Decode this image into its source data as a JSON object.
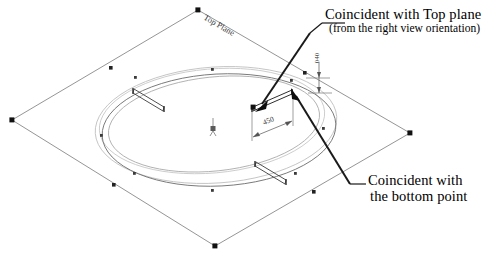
{
  "diagram": {
    "title_label": "Top Plane",
    "origin_marker": "origin-symbol",
    "annotations": {
      "top_callout": {
        "line1": "Coincident with Top plane",
        "line2": "(from the right view orientation)"
      },
      "bottom_callout": {
        "line1": "Coincident with",
        "line2": "the bottom point"
      }
    },
    "dimensions": [
      {
        "name": "horizontal-dimension",
        "value": "450"
      },
      {
        "name": "vertical-dimension",
        "value": "040"
      }
    ],
    "colors": {
      "stroke_dark": "#2b2b2b",
      "stroke_plane": "#6d6d6d",
      "stroke_light": "#9a9a9a",
      "stroke_faint": "#b9b9b9",
      "handle_fill": "#111111",
      "background": "#ffffff",
      "text": "#000000"
    },
    "geometry": {
      "plane_name": "top-plane-boundary",
      "plane_vertices": "198,10 410,133 215,246 12,120",
      "ellipses": [
        {
          "name": "construction-ellipse-outer",
          "cx": 214,
          "cy": 126,
          "rx": 118,
          "ry": 57
        },
        {
          "name": "construction-ellipse-mid",
          "cx": 210,
          "cy": 122,
          "rx": 110,
          "ry": 52
        },
        {
          "name": "profile-ellipse-main",
          "cx": 216,
          "cy": 128,
          "rx": 114,
          "ry": 55
        },
        {
          "name": "profile-ellipse-inner",
          "cx": 212,
          "cy": 124,
          "rx": 104,
          "ry": 48
        }
      ],
      "slots": [
        {
          "name": "slot-upper-left"
        },
        {
          "name": "slot-lower-right"
        },
        {
          "name": "slot-right-dimensioned"
        }
      ]
    }
  }
}
